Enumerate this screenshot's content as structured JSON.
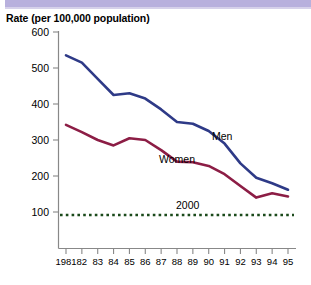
{
  "page": {
    "background_color": "#ffffff",
    "top_bar_color": "#b8b0dd"
  },
  "chart_title": "Rate (per 100,000 population)",
  "chart_data": {
    "type": "line",
    "title": "Rate (per 100,000 population)",
    "xlabel": "",
    "ylabel": "Rate (per 100,000 population)",
    "ylim": [
      0,
      600
    ],
    "yticks": [
      100,
      200,
      300,
      400,
      500,
      600
    ],
    "ytick_labels": [
      "100",
      "200",
      "300",
      "400",
      "500",
      "600"
    ],
    "grid": false,
    "legend": "inline-annotations",
    "x": [
      1981,
      1982,
      1983,
      1984,
      1985,
      1986,
      1987,
      1988,
      1989,
      1990,
      1991,
      1992,
      1993,
      1994,
      1995
    ],
    "xtick_labels": [
      "1981",
      "82",
      "83",
      "84",
      "85",
      "86",
      "87",
      "88",
      "89",
      "90",
      "91",
      "92",
      "93",
      "94",
      "95"
    ],
    "series": [
      {
        "name": "Men",
        "color": "#2e3a87",
        "label": "Men",
        "values": [
          535,
          515,
          470,
          425,
          430,
          415,
          385,
          350,
          345,
          325,
          290,
          235,
          195,
          180,
          162
        ]
      },
      {
        "name": "Women",
        "color": "#8c1d45",
        "label": "Women",
        "values": [
          342,
          322,
          300,
          285,
          305,
          300,
          272,
          240,
          238,
          228,
          205,
          172,
          140,
          152,
          143
        ]
      }
    ],
    "reference_line": {
      "name": "2000",
      "label": "2000",
      "value": 100,
      "color": "#1b4a1b",
      "style": "dotted"
    }
  }
}
